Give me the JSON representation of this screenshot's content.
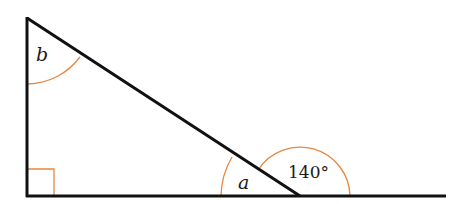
{
  "diagram": {
    "type": "right-triangle-angles",
    "labels": {
      "top_angle": "b",
      "interior_base_angle": "a",
      "exterior_angle": "140°"
    },
    "colors": {
      "lines": "#111111",
      "arcs": "#e8873f"
    },
    "right_angle_marker": true
  }
}
